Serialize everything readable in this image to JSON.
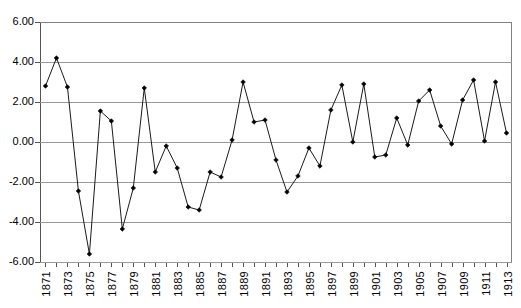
{
  "chart_data": {
    "type": "line",
    "title": "",
    "subtitle": "",
    "xlabel": "",
    "ylabel": "",
    "grid": true,
    "legend": "none",
    "xlim": [
      1871,
      1913
    ],
    "ylim": [
      -6.0,
      6.0
    ],
    "y_ticks": [
      6.0,
      4.0,
      2.0,
      0.0,
      -2.0,
      -4.0,
      -6.0
    ],
    "y_tick_labels": [
      "6.00",
      "4.00",
      "2.00",
      "0.00",
      "-2.00",
      "-4.00",
      "-6.00"
    ],
    "x_tick_labels": [
      "1871",
      "1873",
      "1875",
      "1877",
      "1879",
      "1881",
      "1883",
      "1885",
      "1887",
      "1889",
      "1891",
      "1893",
      "1895",
      "1897",
      "1899",
      "1901",
      "1903",
      "1905",
      "1907",
      "1909",
      "1911",
      "1913"
    ],
    "x_tick_label_step": 2,
    "marker": "diamond",
    "line_color": "#1a1a1a",
    "grid_color": "#9a9a9a",
    "axis_color": "#555555",
    "x": [
      1871,
      1872,
      1873,
      1874,
      1875,
      1876,
      1877,
      1878,
      1879,
      1880,
      1881,
      1882,
      1883,
      1884,
      1885,
      1886,
      1887,
      1888,
      1889,
      1890,
      1891,
      1892,
      1893,
      1894,
      1895,
      1896,
      1897,
      1898,
      1899,
      1900,
      1901,
      1902,
      1903,
      1904,
      1905,
      1906,
      1907,
      1908,
      1909,
      1910,
      1911,
      1912,
      1913
    ],
    "values": [
      2.8,
      4.2,
      2.75,
      -2.45,
      -5.6,
      1.55,
      1.05,
      -4.35,
      -2.3,
      2.7,
      -1.5,
      -0.2,
      -1.3,
      -3.25,
      -3.4,
      -1.5,
      -1.75,
      0.1,
      3.0,
      1.0,
      1.1,
      -0.9,
      -2.5,
      -1.7,
      -0.3,
      -1.2,
      1.6,
      2.85,
      0.0,
      2.9,
      -0.75,
      -0.65,
      1.2,
      -0.15,
      2.05,
      2.6,
      0.8,
      -0.1,
      2.1,
      3.1,
      0.05,
      3.0,
      0.45
    ],
    "series": [
      {
        "name": "series-1",
        "values": [
          2.8,
          4.2,
          2.75,
          -2.45,
          -5.6,
          1.55,
          1.05,
          -4.35,
          -2.3,
          2.7,
          -1.5,
          -0.2,
          -1.3,
          -3.25,
          -3.4,
          -1.5,
          -1.75,
          0.1,
          3.0,
          1.0,
          1.1,
          -0.9,
          -2.5,
          -1.7,
          -0.3,
          -1.2,
          1.6,
          2.85,
          0.0,
          2.9,
          -0.75,
          -0.65,
          1.2,
          -0.15,
          2.05,
          2.6,
          0.8,
          -0.1,
          2.1,
          3.1,
          0.05,
          3.0,
          0.45
        ]
      }
    ]
  }
}
